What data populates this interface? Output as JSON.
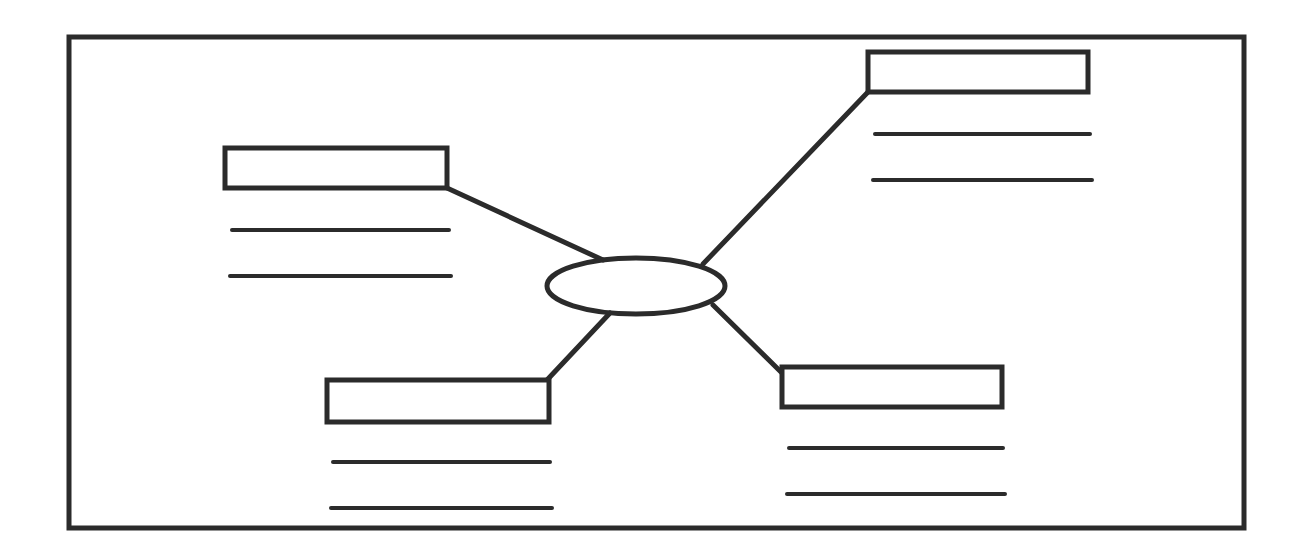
{
  "diagram": {
    "type": "mind-map-template",
    "stroke_color": "#2b2b2b",
    "background": "#ffffff",
    "frame": {
      "x": 69,
      "y": 37,
      "width": 1175,
      "height": 491,
      "stroke_width": 5
    },
    "center": {
      "cx": 636,
      "cy": 286,
      "rx": 89,
      "ry": 28,
      "stroke_width": 5,
      "label": ""
    },
    "branches": [
      {
        "id": "top-left",
        "label": "",
        "box": {
          "x": 225,
          "y": 148,
          "width": 222,
          "height": 40
        },
        "connector": {
          "x1": 447,
          "y1": 188,
          "x2": 603,
          "y2": 260
        },
        "lines": [
          {
            "x1": 232,
            "y1": 230,
            "x2": 449
          },
          {
            "x1": 230,
            "y1": 276,
            "x2": 451
          }
        ]
      },
      {
        "id": "top-right",
        "label": "",
        "box": {
          "x": 868,
          "y": 52,
          "width": 220,
          "height": 40
        },
        "connector": {
          "x1": 868,
          "y1": 92,
          "x2": 703,
          "y2": 264
        },
        "lines": [
          {
            "x1": 875,
            "y1": 134,
            "x2": 1090
          },
          {
            "x1": 873,
            "y1": 180,
            "x2": 1092
          }
        ]
      },
      {
        "id": "bottom-left",
        "label": "",
        "box": {
          "x": 327,
          "y": 380,
          "width": 222,
          "height": 42
        },
        "connector": {
          "x1": 547,
          "y1": 380,
          "x2": 610,
          "y2": 313
        },
        "lines": [
          {
            "x1": 333,
            "y1": 462,
            "x2": 550
          },
          {
            "x1": 331,
            "y1": 508,
            "x2": 552
          }
        ]
      },
      {
        "id": "bottom-right",
        "label": "",
        "box": {
          "x": 782,
          "y": 367,
          "width": 220,
          "height": 40
        },
        "connector": {
          "x1": 782,
          "y1": 373,
          "x2": 713,
          "y2": 305
        },
        "lines": [
          {
            "x1": 789,
            "y1": 448,
            "x2": 1003
          },
          {
            "x1": 787,
            "y1": 494,
            "x2": 1005
          }
        ]
      }
    ]
  }
}
